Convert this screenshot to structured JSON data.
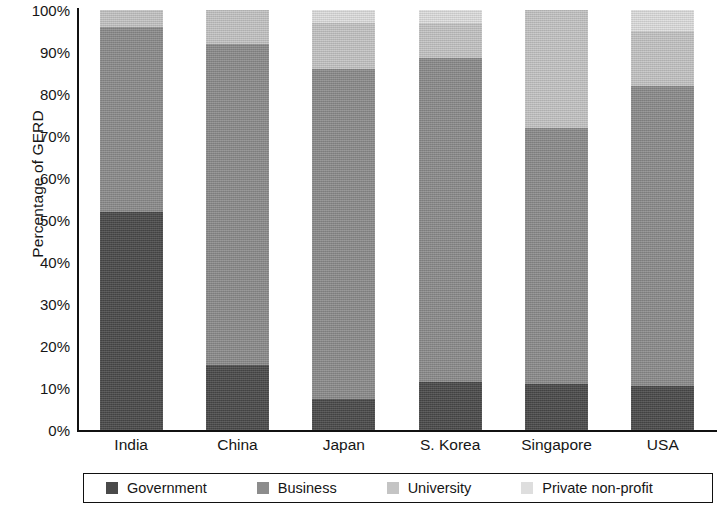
{
  "chart": {
    "type": "bar",
    "ylabel": "Percentage of GERD"
  },
  "yticks": [
    {
      "label": "100%",
      "value": 100
    },
    {
      "label": "90%",
      "value": 90
    },
    {
      "label": "80%",
      "value": 80
    },
    {
      "label": "70%",
      "value": 70
    },
    {
      "label": "60%",
      "value": 60
    },
    {
      "label": "50%",
      "value": 50
    },
    {
      "label": "40%",
      "value": 40
    },
    {
      "label": "30%",
      "value": 30
    },
    {
      "label": "20%",
      "value": 20
    },
    {
      "label": "10%",
      "value": 10
    },
    {
      "label": "0%",
      "value": 0
    }
  ],
  "legend": {
    "items": [
      {
        "label": "Government",
        "color": "#4a4a4a"
      },
      {
        "label": "Business",
        "color": "#8c8c8c"
      },
      {
        "label": "University",
        "color": "#c4c4c4"
      },
      {
        "label": "Private non-profit",
        "color": "#dedede"
      }
    ]
  },
  "chart_data": {
    "type": "bar",
    "stacked": true,
    "stack_mode": "percent",
    "title": "",
    "subtitle": "",
    "xlabel": "",
    "ylabel": "Percentage of GERD",
    "ylim": [
      0,
      100
    ],
    "ytick_labels": [
      "0%",
      "10%",
      "20%",
      "30%",
      "40%",
      "50%",
      "60%",
      "70%",
      "80%",
      "90%",
      "100%"
    ],
    "grid": false,
    "legend_position": "bottom",
    "categories": [
      "India",
      "China",
      "Japan",
      "S. Korea",
      "Singapore",
      "USA"
    ],
    "series": [
      {
        "name": "Government",
        "color": "#4a4a4a",
        "values": [
          52,
          15.5,
          7.5,
          11.5,
          11,
          10.5
        ]
      },
      {
        "name": "Business",
        "color": "#8c8c8c",
        "values": [
          44,
          76.5,
          78.5,
          77,
          61,
          71.5
        ]
      },
      {
        "name": "University",
        "color": "#c4c4c4",
        "values": [
          4,
          8,
          11,
          8.5,
          28,
          13
        ]
      },
      {
        "name": "Private non-profit",
        "color": "#dedede",
        "values": [
          0,
          0,
          3,
          3,
          0,
          5
        ]
      }
    ],
    "cumulative_tops": {
      "India": {
        "Government": 52,
        "Business": 96,
        "University": 100,
        "Private non-profit": 100
      },
      "China": {
        "Government": 15.5,
        "Business": 92,
        "University": 100,
        "Private non-profit": 100
      },
      "Japan": {
        "Government": 7.5,
        "Business": 86,
        "University": 97,
        "Private non-profit": 100
      },
      "S. Korea": {
        "Government": 11.5,
        "Business": 88.5,
        "University": 97,
        "Private non-profit": 100
      },
      "Singapore": {
        "Government": 11,
        "Business": 72,
        "University": 100,
        "Private non-profit": 100
      },
      "USA": {
        "Government": 10.5,
        "Business": 82,
        "University": 95,
        "Private non-profit": 100
      }
    }
  }
}
